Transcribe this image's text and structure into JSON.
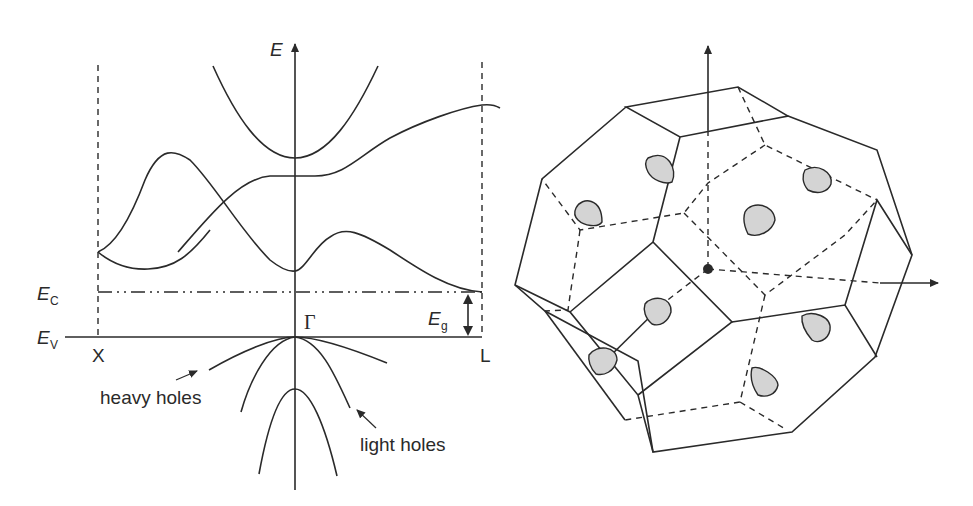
{
  "band_diagram": {
    "axis_label": "E",
    "conduction_edge": {
      "symbol": "E",
      "subscript": "C"
    },
    "valence_edge": {
      "symbol": "E",
      "subscript": "V"
    },
    "gap": {
      "symbol": "E",
      "subscript": "g"
    },
    "points": {
      "left": "X",
      "center": "Γ",
      "right": "L"
    },
    "annotations": {
      "heavy_holes": "heavy holes",
      "light_holes": "light holes"
    }
  },
  "brillouin_zone": {
    "shape": "truncated octahedron",
    "pocket_count": 8,
    "pocket_color": "#d4d4d4"
  },
  "colors": {
    "line": "#2a2a2a",
    "background": "#ffffff"
  }
}
